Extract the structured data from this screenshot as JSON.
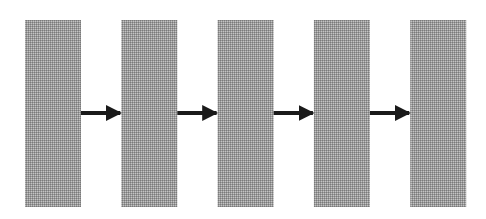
{
  "diagram": {
    "type": "flow",
    "direction": "left-to-right",
    "nodes": [
      {
        "id": "block-1",
        "label": ""
      },
      {
        "id": "block-2",
        "label": ""
      },
      {
        "id": "block-3",
        "label": ""
      },
      {
        "id": "block-4",
        "label": ""
      },
      {
        "id": "block-5",
        "label": ""
      }
    ],
    "edges": [
      {
        "from": "block-1",
        "to": "block-2"
      },
      {
        "from": "block-2",
        "to": "block-3"
      },
      {
        "from": "block-3",
        "to": "block-4"
      },
      {
        "from": "block-4",
        "to": "block-5"
      }
    ],
    "colors": {
      "block_fill": "#9a9a9a",
      "block_dither_light": "#c4c4c4",
      "block_dither_dark": "#7a7a7a",
      "arrow": "#1a1a1a",
      "background": "#ffffff"
    }
  }
}
